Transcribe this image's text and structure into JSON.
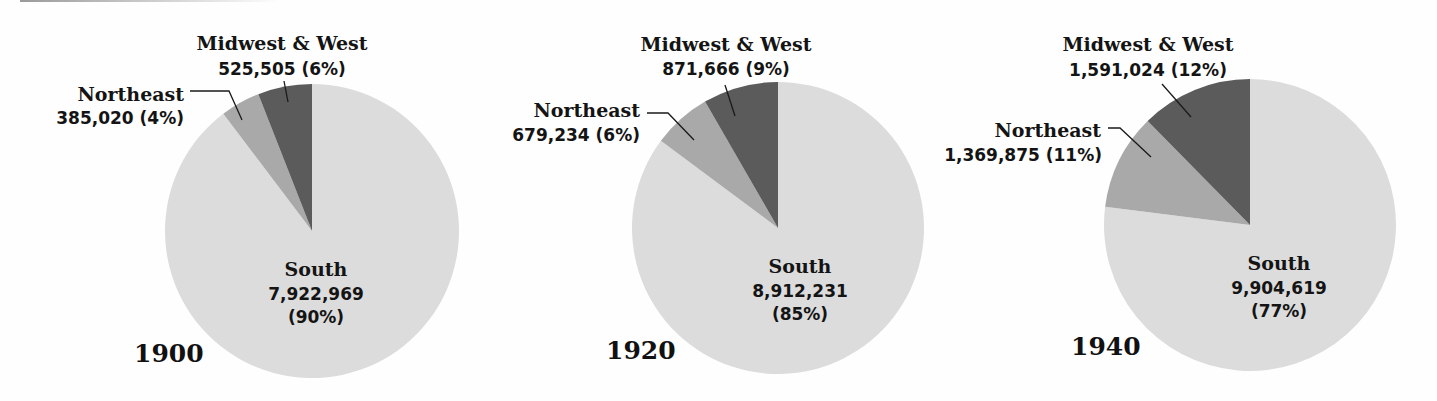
{
  "colors": {
    "south": "#dcdcdc",
    "northeast": "#a9a9a9",
    "midwest_west": "#5b5b5b",
    "background": "#fefefe",
    "text": "#141414"
  },
  "charts": [
    {
      "year": "1900",
      "south": {
        "label": "South",
        "value": "7,922,969",
        "pct": "(90%)"
      },
      "northeast": {
        "label": "Northeast",
        "value_pct": "385,020 (4%)"
      },
      "midwest_west": {
        "label": "Midwest & West",
        "value_pct": "525,505 (6%)"
      }
    },
    {
      "year": "1920",
      "south": {
        "label": "South",
        "value": "8,912,231",
        "pct": "(85%)"
      },
      "northeast": {
        "label": "Northeast",
        "value_pct": "679,234 (6%)"
      },
      "midwest_west": {
        "label": "Midwest & West",
        "value_pct": "871,666 (9%)"
      }
    },
    {
      "year": "1940",
      "south": {
        "label": "South",
        "value": "9,904,619",
        "pct": "(77%)"
      },
      "northeast": {
        "label": "Northeast",
        "value_pct": "1,369,875 (11%)"
      },
      "midwest_west": {
        "label": "Midwest & West",
        "value_pct": "1,591,024 (12%)"
      }
    }
  ],
  "chart_data": [
    {
      "type": "pie",
      "title": "1900",
      "categories": [
        "South",
        "Northeast",
        "Midwest & West"
      ],
      "values": [
        7922969,
        385020,
        525505
      ],
      "percent_labels": [
        "90%",
        "4%",
        "6%"
      ],
      "colors": [
        "#dcdcdc",
        "#a9a9a9",
        "#5b5b5b"
      ],
      "start_angle": "12 o'clock; Midwest & West then Northeast counterclockwise"
    },
    {
      "type": "pie",
      "title": "1920",
      "categories": [
        "South",
        "Northeast",
        "Midwest & West"
      ],
      "values": [
        8912231,
        679234,
        871666
      ],
      "percent_labels": [
        "85%",
        "6%",
        "9%"
      ],
      "colors": [
        "#dcdcdc",
        "#a9a9a9",
        "#5b5b5b"
      ],
      "start_angle": "12 o'clock; Midwest & West then Northeast counterclockwise"
    },
    {
      "type": "pie",
      "title": "1940",
      "categories": [
        "South",
        "Northeast",
        "Midwest & West"
      ],
      "values": [
        9904619,
        1369875,
        1591024
      ],
      "percent_labels": [
        "77%",
        "11%",
        "12%"
      ],
      "colors": [
        "#dcdcdc",
        "#a9a9a9",
        "#5b5b5b"
      ],
      "start_angle": "12 o'clock; Midwest & West then Northeast counterclockwise"
    }
  ]
}
